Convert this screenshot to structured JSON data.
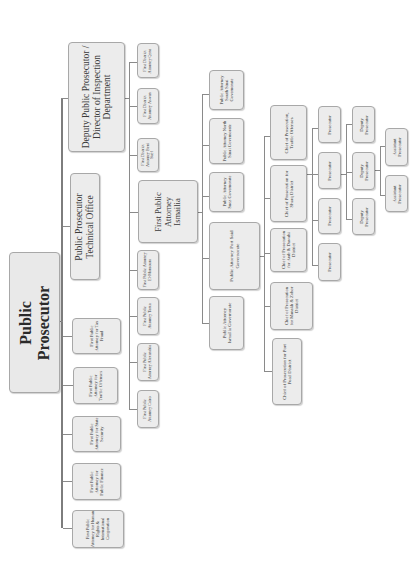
{
  "diagram": {
    "type": "org-chart",
    "orientation": "rotated-90-ccw",
    "root": {
      "label": "Public Prosecutor"
    },
    "level1": {
      "deputy": {
        "label": "Deputy Public Prosecutor / Director of Inspection Department"
      },
      "technical_office": {
        "label": "Public Prosecutor Technical Office"
      },
      "tax_fraud": {
        "label": "First Public Attorney for Tax Fraud"
      },
      "traffic_offenses": {
        "label": "First Public Attorney for Traffic Offenses"
      },
      "state_security": {
        "label": "First Public Attorney for State Security"
      },
      "public_finance": {
        "label": "First Public Attorney for Public Finance"
      },
      "human_rights": {
        "label": "First Public Attorney for Human Rights & International Cooperation"
      }
    },
    "district_attorneys": [
      {
        "label": "First District Attorney Qena"
      },
      {
        "label": "First District Attorney Aswan"
      },
      {
        "label": "First District Attorney Beni Suef"
      }
    ],
    "first_public_attorneys": [
      {
        "label": "First Public Attorney El-Mansoura"
      },
      {
        "label": "First Public Attorney Tanta"
      },
      {
        "label": "First Public Attorney Alexandria"
      },
      {
        "label": "First Public Attorney Cairo"
      }
    ],
    "ismailia": {
      "label": "First Public Attorney Ismailia"
    },
    "governorates": [
      {
        "label": "Public Attorney South Sinai Governorate"
      },
      {
        "label": "Public Attorney North Sinai Governorate"
      },
      {
        "label": "Public Attorney Suez Governorate"
      },
      {
        "label": "Public Attorney Port Said Governorate"
      },
      {
        "label": "Public Attorney Ismailia Governorate"
      }
    ],
    "chiefs": [
      {
        "label": "Chief of Prosecution, Traffic Offenses"
      },
      {
        "label": "Chief of Prosecution for Sharq District"
      },
      {
        "label": "Chief of Prosecution for Arab & Dawahi District"
      },
      {
        "label": "Chief of Prosecution for Manakh & Zohor District"
      },
      {
        "label": "Chief of Prosecution for Port Fuad District"
      }
    ],
    "prosecutors": [
      {
        "label": "Prosecutor"
      },
      {
        "label": "Prosecutor"
      },
      {
        "label": "Prosecutor"
      },
      {
        "label": "Prosecutor"
      }
    ],
    "deputy_prosecutors": [
      {
        "label": "Deputy Prosecutor"
      },
      {
        "label": "Deputy Prosecutor"
      },
      {
        "label": "Deputy Prosecutor"
      }
    ],
    "assistant_prosecutors": [
      {
        "label": "Assistant Prosecutor"
      },
      {
        "label": "Assistant Prosecutor"
      }
    ]
  }
}
